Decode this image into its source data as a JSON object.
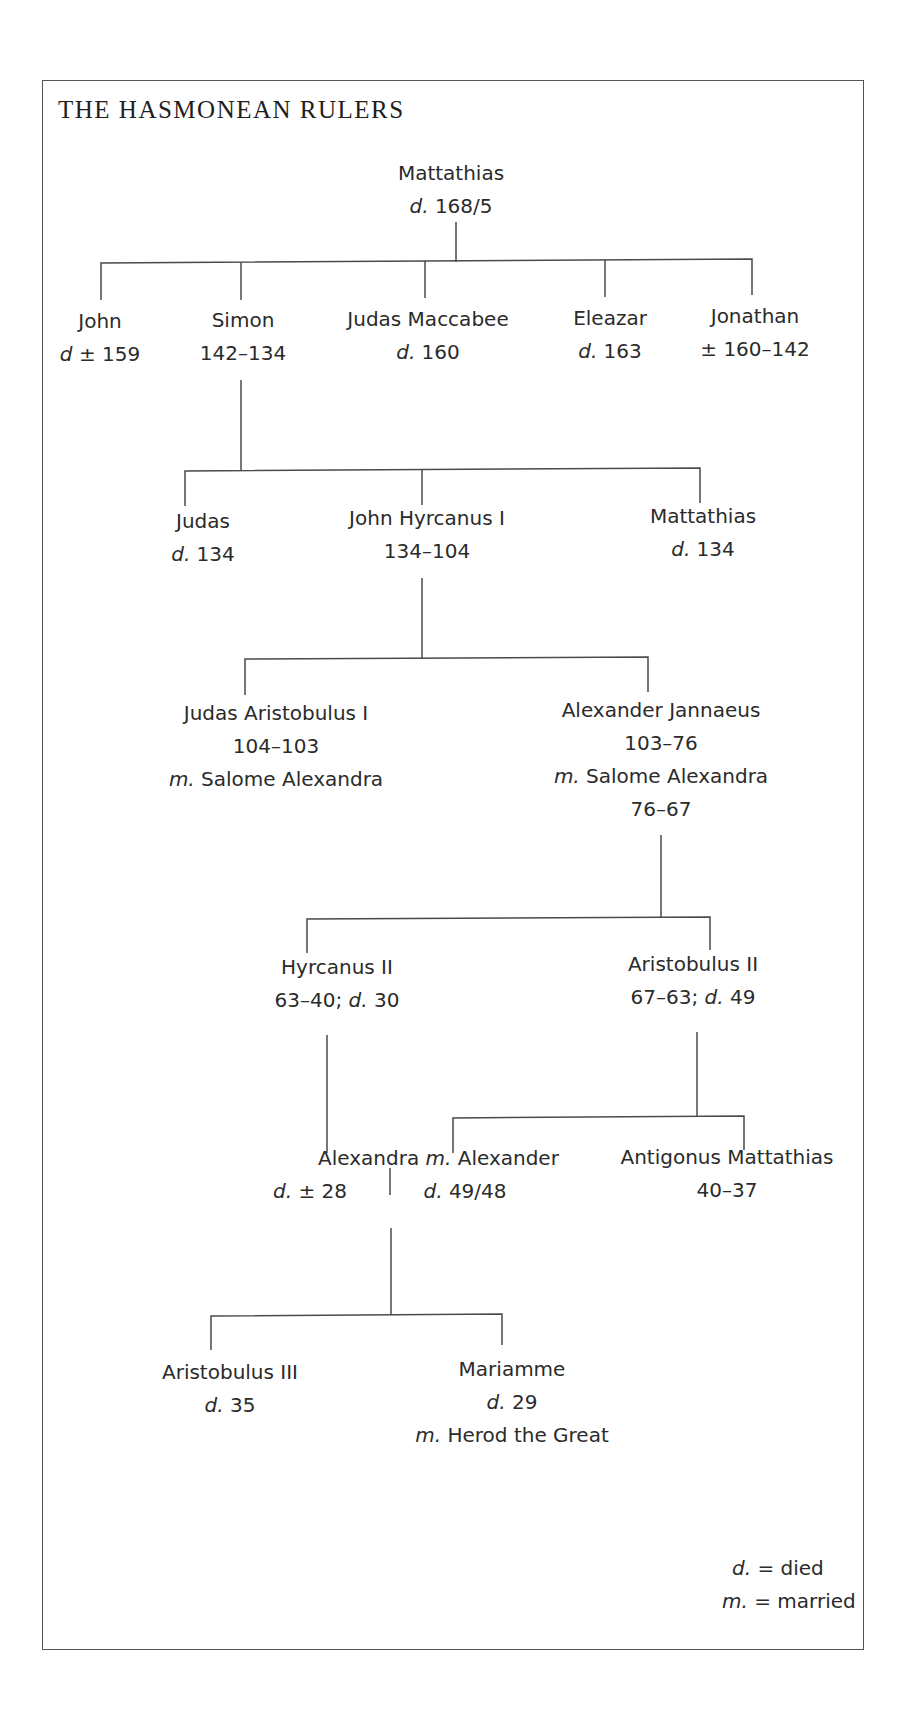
{
  "title": "THE HASMONEAN RULERS",
  "tree": {
    "root": {
      "name": "Mattathias",
      "d_prefix": "d.",
      "d_value": " 168/5"
    },
    "gen1": [
      {
        "name": "John",
        "line2_prefix": "d",
        "line2": " ± 159"
      },
      {
        "name": "Simon",
        "line2": "142–134"
      },
      {
        "name": "Judas Maccabee",
        "line2_prefix": "d.",
        "line2": " 160"
      },
      {
        "name": "Eleazar",
        "line2_prefix": "d.",
        "line2": " 163"
      },
      {
        "name": "Jonathan",
        "line2": "± 160–142"
      }
    ],
    "gen2": [
      {
        "name": "Judas",
        "line2_prefix": "d.",
        "line2": " 134"
      },
      {
        "name": "John Hyrcanus I",
        "line2": "134–104"
      },
      {
        "name": "Mattathias",
        "line2_prefix": "d.",
        "line2": " 134"
      }
    ],
    "gen3": [
      {
        "name": "Judas Aristobulus I",
        "line2": "104–103",
        "line3_prefix": "m.",
        "line3": " Salome Alexandra"
      },
      {
        "name": "Alexander Jannaeus",
        "line2": "103–76",
        "line3_prefix": "m.",
        "line3": " Salome Alexandra",
        "line4": "76–67"
      }
    ],
    "gen4": [
      {
        "name": "Hyrcanus II",
        "line2": "63–40; ",
        "line2_prefix2": "d.",
        "line2b": " 30"
      },
      {
        "name": "Aristobulus II",
        "line2": "67–63; ",
        "line2_prefix2": "d.",
        "line2b": " 49"
      }
    ],
    "gen5": {
      "alexandra": {
        "name": "Alexandra",
        "line2_prefix": "d.",
        "line2": " ± 28"
      },
      "married_prefix": "m.",
      "alexander": {
        "name": " Alexander",
        "line2_prefix": "d.",
        "line2": " 49/48"
      },
      "antigonus": {
        "name": "Antigonus Mattathias",
        "line2": "40–37"
      }
    },
    "gen6": [
      {
        "name": "Aristobulus III",
        "line2_prefix": "d.",
        "line2": " 35"
      },
      {
        "name": "Mariamme",
        "line2_prefix": "d.",
        "line2": " 29",
        "line3_prefix": "m.",
        "line3": " Herod the Great"
      }
    ]
  },
  "legend": [
    {
      "abbr": "d.",
      "meaning": " = died"
    },
    {
      "abbr": "m.",
      "meaning": " = married"
    }
  ],
  "colors": {
    "line": "#4a4a4a",
    "text": "#2b2b2b",
    "border": "#555555"
  }
}
